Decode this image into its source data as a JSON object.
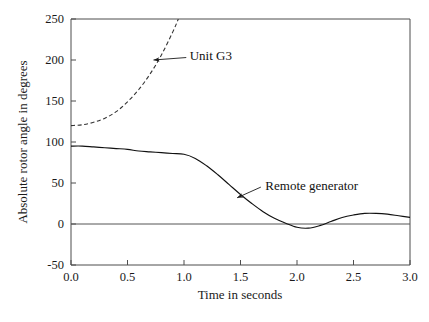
{
  "chart_data": {
    "type": "line",
    "title": "",
    "xlabel": "Time in seconds",
    "ylabel": "Absolute rotor angle in degrees",
    "xlim": [
      0.0,
      3.0
    ],
    "ylim": [
      -50,
      250
    ],
    "xticks": [
      "0.0",
      "0.5",
      "1.0",
      "1.5",
      "2.0",
      "2.5",
      "3.0"
    ],
    "xtick_values": [
      0.0,
      0.5,
      1.0,
      1.5,
      2.0,
      2.5,
      3.0
    ],
    "yticks": [
      "-50",
      "0",
      "50",
      "100",
      "150",
      "200",
      "250"
    ],
    "ytick_values": [
      -50,
      0,
      50,
      100,
      150,
      200,
      250
    ],
    "grid": false,
    "legend_position": "inline-annotations",
    "zero_reference_line": 0,
    "series": [
      {
        "name": "Unit G3",
        "style": "dashed",
        "color": "#333333",
        "x": [
          0.0,
          0.1,
          0.2,
          0.3,
          0.4,
          0.5,
          0.6,
          0.7,
          0.8,
          0.9,
          0.95
        ],
        "values": [
          120,
          121,
          124,
          129,
          137,
          149,
          164,
          183,
          206,
          234,
          250
        ]
      },
      {
        "name": "Remote generator",
        "style": "solid",
        "color": "#111111",
        "x": [
          0.0,
          0.1,
          0.2,
          0.3,
          0.4,
          0.5,
          0.6,
          0.7,
          0.8,
          0.9,
          1.0,
          1.1,
          1.2,
          1.3,
          1.4,
          1.5,
          1.6,
          1.7,
          1.8,
          1.9,
          2.0,
          2.1,
          2.2,
          2.3,
          2.4,
          2.5,
          2.6,
          2.7,
          2.8,
          2.9,
          3.0
        ],
        "values": [
          95,
          95,
          94,
          93,
          92,
          91,
          89,
          88,
          87,
          86,
          85,
          80,
          71,
          60,
          48,
          36,
          25,
          15,
          7,
          1,
          -4,
          -5,
          -2,
          3,
          8,
          11,
          13,
          13,
          12,
          10,
          8
        ]
      }
    ],
    "annotations": [
      {
        "label": "Unit G3",
        "text_x": 1.05,
        "text_y": 205,
        "arrow_from_x": 1.02,
        "arrow_from_y": 203,
        "arrow_to_x": 0.73,
        "arrow_to_y": 200,
        "arrow": "left"
      },
      {
        "label": "Remote generator",
        "text_x": 1.72,
        "text_y": 47,
        "arrow_from_x": 1.68,
        "arrow_from_y": 45,
        "arrow_to_x": 1.47,
        "arrow_to_y": 32,
        "arrow": "down-left"
      }
    ]
  }
}
